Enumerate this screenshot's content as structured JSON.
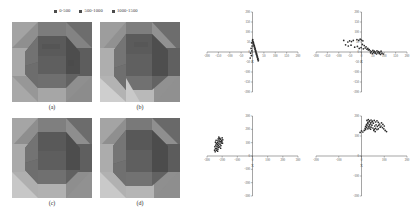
{
  "figure": {
    "title": "",
    "background": "#ffffff"
  },
  "legend": {
    "position": "top-center",
    "entries": [
      {
        "label": "0-500",
        "color": "#4c4c4c",
        "range_min": 0,
        "range_max": 500
      },
      {
        "label": "500-1000",
        "color": "#4c4c4c",
        "range_min": 500,
        "range_max": 1000
      },
      {
        "label": "1000-1500",
        "color": "#4c4c4c",
        "range_min": 1000,
        "range_max": 1500
      }
    ]
  },
  "panels": [
    {
      "caption": "(a)",
      "type": "faceted-solid-render",
      "palette": [
        "#b4b4b4",
        "#a0a0a0",
        "#8d8d8d",
        "#7c7c7c",
        "#6d6d6d",
        "#5e5e5e",
        "#525252",
        "#464646"
      ]
    },
    {
      "caption": "(b)",
      "type": "faceted-solid-render",
      "palette": [
        "#c2c2c2",
        "#aaaaaa",
        "#949494",
        "#828282",
        "#717171",
        "#616161",
        "#545454",
        "#474747"
      ]
    },
    {
      "caption": "(c)",
      "type": "faceted-solid-render",
      "palette": [
        "#bcbcbc",
        "#a6a6a6",
        "#919191",
        "#808080",
        "#6f6f6f",
        "#606060",
        "#535353",
        "#464646"
      ]
    },
    {
      "caption": "(d)",
      "type": "faceted-solid-render",
      "palette": [
        "#bdbdbd",
        "#a8a8a8",
        "#939393",
        "#818181",
        "#707070",
        "#606060",
        "#525252",
        "#454545"
      ]
    }
  ],
  "chart_data": [
    {
      "id": "scatter-top-left",
      "type": "scatter",
      "title": "",
      "xlabel": "X",
      "ylabel": "Y",
      "xlim": [
        -200,
        200
      ],
      "ylim": [
        -200,
        200
      ],
      "xticks": [
        -200,
        -150,
        -100,
        -50,
        0,
        50,
        100,
        150,
        200
      ],
      "yticks": [
        -200,
        -150,
        -100,
        -50,
        0,
        50,
        100,
        150,
        200
      ],
      "grid": false,
      "marker_color": "#2b2b2b",
      "points": [
        [
          2,
          52
        ],
        [
          4,
          48
        ],
        [
          3,
          44
        ],
        [
          6,
          40
        ],
        [
          5,
          36
        ],
        [
          8,
          32
        ],
        [
          7,
          28
        ],
        [
          10,
          24
        ],
        [
          9,
          20
        ],
        [
          12,
          16
        ],
        [
          11,
          12
        ],
        [
          14,
          8
        ],
        [
          13,
          4
        ],
        [
          16,
          0
        ],
        [
          15,
          -4
        ],
        [
          18,
          -8
        ],
        [
          17,
          -12
        ],
        [
          20,
          -16
        ],
        [
          19,
          -20
        ],
        [
          22,
          -24
        ],
        [
          21,
          -28
        ],
        [
          24,
          -32
        ],
        [
          23,
          -36
        ],
        [
          -4,
          46
        ],
        [
          -2,
          30
        ],
        [
          -6,
          18
        ],
        [
          -3,
          6
        ],
        [
          -8,
          -6
        ],
        [
          -5,
          -18
        ],
        [
          -10,
          -30
        ],
        [
          0,
          58
        ],
        [
          1,
          62
        ],
        [
          26,
          -40
        ],
        [
          25,
          -44
        ]
      ]
    },
    {
      "id": "scatter-top-right",
      "type": "scatter",
      "title": "",
      "xlabel": "X",
      "ylabel": "Y",
      "xlim": [
        -200,
        200
      ],
      "ylim": [
        -200,
        200
      ],
      "xticks": [
        -200,
        -150,
        -100,
        -50,
        0,
        50,
        100,
        150,
        200
      ],
      "yticks": [
        -200,
        -150,
        -100,
        -50,
        0,
        50,
        100,
        150,
        200
      ],
      "grid": false,
      "marker_color": "#2b2b2b",
      "points": [
        [
          -78,
          58
        ],
        [
          -60,
          50
        ],
        [
          -52,
          56
        ],
        [
          -44,
          52
        ],
        [
          -36,
          58
        ],
        [
          -20,
          62
        ],
        [
          -12,
          58
        ],
        [
          -6,
          64
        ],
        [
          0,
          60
        ],
        [
          6,
          56
        ],
        [
          -70,
          36
        ],
        [
          -58,
          30
        ],
        [
          -46,
          34
        ],
        [
          -30,
          24
        ],
        [
          -18,
          28
        ],
        [
          -10,
          18
        ],
        [
          -2,
          22
        ],
        [
          8,
          16
        ],
        [
          16,
          20
        ],
        [
          24,
          14
        ],
        [
          30,
          10
        ],
        [
          38,
          6
        ],
        [
          44,
          2
        ],
        [
          50,
          8
        ],
        [
          56,
          4
        ],
        [
          62,
          0
        ],
        [
          68,
          6
        ],
        [
          74,
          2
        ],
        [
          80,
          -2
        ],
        [
          86,
          4
        ],
        [
          40,
          -4
        ],
        [
          48,
          -8
        ],
        [
          54,
          -2
        ],
        [
          60,
          -6
        ],
        [
          66,
          -10
        ],
        [
          72,
          -4
        ],
        [
          78,
          -8
        ],
        [
          84,
          -12
        ],
        [
          90,
          -6
        ],
        [
          96,
          -10
        ],
        [
          34,
          12
        ],
        [
          28,
          18
        ],
        [
          20,
          26
        ],
        [
          12,
          32
        ],
        [
          4,
          38
        ]
      ]
    },
    {
      "id": "scatter-bottom-left",
      "type": "scatter",
      "title": "",
      "xlabel": "X",
      "ylabel": "Y",
      "xlim": [
        -300,
        300
      ],
      "ylim": [
        -300,
        300
      ],
      "xticks": [
        -300,
        -200,
        -100,
        0,
        100,
        200,
        300
      ],
      "yticks": [
        -300,
        -200,
        -100,
        0,
        100,
        200,
        300
      ],
      "grid": false,
      "marker_color": "#2b2b2b",
      "points": [
        [
          -222,
          142
        ],
        [
          -216,
          134
        ],
        [
          -226,
          128
        ],
        [
          -218,
          120
        ],
        [
          -228,
          114
        ],
        [
          -220,
          106
        ],
        [
          -230,
          100
        ],
        [
          -222,
          92
        ],
        [
          -232,
          86
        ],
        [
          -224,
          78
        ],
        [
          -234,
          72
        ],
        [
          -226,
          64
        ],
        [
          -236,
          58
        ],
        [
          -228,
          50
        ],
        [
          -238,
          44
        ],
        [
          -230,
          36
        ],
        [
          -210,
          126
        ],
        [
          -204,
          116
        ],
        [
          -212,
          108
        ],
        [
          -206,
          98
        ],
        [
          -214,
          88
        ],
        [
          -208,
          78
        ],
        [
          -216,
          68
        ],
        [
          -210,
          58
        ],
        [
          -240,
          118
        ],
        [
          -244,
          104
        ],
        [
          -238,
          94
        ],
        [
          -242,
          82
        ],
        [
          -248,
          70
        ],
        [
          -244,
          56
        ],
        [
          -250,
          44
        ],
        [
          -246,
          32
        ],
        [
          -200,
          136
        ],
        [
          -196,
          122
        ],
        [
          -202,
          110
        ],
        [
          -198,
          96
        ]
      ]
    },
    {
      "id": "scatter-bottom-right",
      "type": "scatter",
      "title": "",
      "xlabel": "X",
      "ylabel": "Y",
      "xlim": [
        -200,
        200
      ],
      "ylim": [
        -200,
        200
      ],
      "xticks": [
        -200,
        -100,
        0,
        100,
        200
      ],
      "yticks": [
        -200,
        -100,
        0,
        100,
        200
      ],
      "grid": false,
      "marker_color": "#2b2b2b",
      "points": [
        [
          24,
          178
        ],
        [
          30,
          182
        ],
        [
          36,
          176
        ],
        [
          42,
          180
        ],
        [
          48,
          174
        ],
        [
          28,
          168
        ],
        [
          34,
          172
        ],
        [
          40,
          166
        ],
        [
          46,
          170
        ],
        [
          52,
          164
        ],
        [
          22,
          158
        ],
        [
          28,
          162
        ],
        [
          34,
          156
        ],
        [
          40,
          160
        ],
        [
          46,
          154
        ],
        [
          18,
          148
        ],
        [
          24,
          152
        ],
        [
          30,
          146
        ],
        [
          36,
          150
        ],
        [
          42,
          144
        ],
        [
          56,
          178
        ],
        [
          62,
          170
        ],
        [
          68,
          176
        ],
        [
          74,
          168
        ],
        [
          80,
          160
        ],
        [
          58,
          150
        ],
        [
          64,
          156
        ],
        [
          70,
          148
        ],
        [
          76,
          154
        ],
        [
          82,
          144
        ],
        [
          16,
          138
        ],
        [
          22,
          142
        ],
        [
          28,
          136
        ],
        [
          34,
          140
        ],
        [
          40,
          134
        ],
        [
          50,
          140
        ],
        [
          56,
          134
        ],
        [
          62,
          138
        ],
        [
          68,
          132
        ],
        [
          74,
          136
        ],
        [
          86,
          150
        ],
        [
          92,
          142
        ],
        [
          98,
          136
        ],
        [
          104,
          128
        ],
        [
          110,
          122
        ],
        [
          12,
          128
        ],
        [
          18,
          132
        ],
        [
          6,
          120
        ],
        [
          0,
          126
        ],
        [
          -6,
          118
        ],
        [
          88,
          166
        ],
        [
          94,
          158
        ],
        [
          100,
          150
        ],
        [
          54,
          128
        ],
        [
          60,
          122
        ]
      ]
    }
  ]
}
